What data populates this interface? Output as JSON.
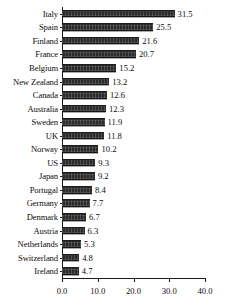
{
  "chart_data": {
    "type": "bar",
    "orientation": "horizontal",
    "title": "",
    "subtitle": "",
    "xlabel": "",
    "ylabel": "",
    "xlim": [
      0.0,
      40.0
    ],
    "xticks": [
      "0.0",
      "10.0",
      "20.0",
      "30.0",
      "40.0"
    ],
    "xtick_values": [
      0.0,
      10.0,
      20.0,
      30.0,
      40.0
    ],
    "grid": false,
    "legend": false,
    "legend_position": "none",
    "bar_color": "#2b2b2b",
    "axis_color": "#1a1a1a",
    "data_labels": true,
    "categories": [
      "Italy",
      "Spain",
      "Finland",
      "France",
      "Belgium",
      "New Zealand",
      "Canada",
      "Australia",
      "Sweden",
      "UK",
      "Norway",
      "US",
      "Japan",
      "Portugal",
      "Germany",
      "Denmark",
      "Austria",
      "Netherlands",
      "Switzerland",
      "Ireland"
    ],
    "values": [
      31.5,
      25.5,
      21.6,
      20.7,
      15.2,
      13.2,
      12.6,
      12.3,
      11.9,
      11.8,
      10.2,
      9.3,
      9.2,
      8.4,
      7.7,
      6.7,
      6.3,
      5.3,
      4.8,
      4.7
    ],
    "value_labels": [
      "31.5",
      "25.5",
      "21.6",
      "20.7",
      "15.2",
      "13.2",
      "12.6",
      "12.3",
      "11.9",
      "11.8",
      "10.2",
      "9.3",
      "9.2",
      "8.4",
      "7.7",
      "6.7",
      "6.3",
      "5.3",
      "4.8",
      "4.7"
    ]
  }
}
